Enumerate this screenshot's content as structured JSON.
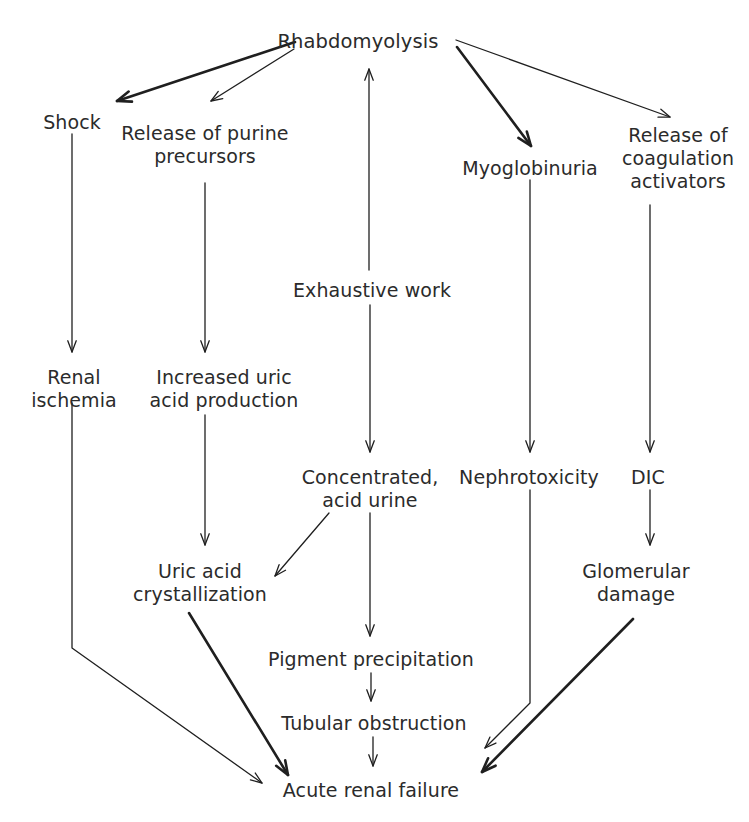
{
  "diagram": {
    "stroke_color": "#1f1f1f",
    "text_color": "#2b2b2b",
    "background": "#ffffff",
    "nodes": [
      {
        "id": "rhabdomyolysis",
        "label": "Rhabdomyolysis",
        "x": 358,
        "y": 30
      },
      {
        "id": "shock",
        "label": "Shock",
        "x": 72,
        "y": 111
      },
      {
        "id": "release-purine-precursors",
        "label": "Release of purine\nprecursors",
        "x": 205,
        "y": 122
      },
      {
        "id": "myoglobinuria",
        "label": "Myoglobinuria",
        "x": 530,
        "y": 157
      },
      {
        "id": "release-coagulation-activators",
        "label": "Release of\ncoagulation\nactivators",
        "x": 678,
        "y": 124
      },
      {
        "id": "exhaustive-work",
        "label": "Exhaustive work",
        "x": 372,
        "y": 279
      },
      {
        "id": "renal-ischemia",
        "label": "Renal\nischemia",
        "x": 74,
        "y": 366
      },
      {
        "id": "increased-uric-acid-production",
        "label": "Increased uric\nacid production",
        "x": 224,
        "y": 366
      },
      {
        "id": "concentrated-acid-urine",
        "label": "Concentrated,\nacid urine",
        "x": 370,
        "y": 466
      },
      {
        "id": "nephrotoxicity",
        "label": "Nephrotoxicity",
        "x": 529,
        "y": 466
      },
      {
        "id": "dic",
        "label": "DIC",
        "x": 648,
        "y": 466
      },
      {
        "id": "uric-acid-crystallization",
        "label": "Uric acid\ncrystallization",
        "x": 200,
        "y": 560
      },
      {
        "id": "glomerular-damage",
        "label": "Glomerular\ndamage",
        "x": 636,
        "y": 560
      },
      {
        "id": "pigment-precipitation",
        "label": "Pigment precipitation",
        "x": 371,
        "y": 648
      },
      {
        "id": "tubular-obstruction",
        "label": "Tubular obstruction",
        "x": 374,
        "y": 712
      },
      {
        "id": "acute-renal-failure",
        "label": "Acute renal failure",
        "x": 371,
        "y": 779
      }
    ],
    "edges": [
      {
        "id": "rhabdomyolysis-to-shock",
        "from": "rhabdomyolysis",
        "to": "shock",
        "points": [
          [
            295,
            42
          ],
          [
            117,
            101
          ]
        ],
        "weight": "thick"
      },
      {
        "id": "rhabdomyolysis-to-release-purine-precursors",
        "from": "rhabdomyolysis",
        "to": "release-purine-precursors",
        "points": [
          [
            294,
            49
          ],
          [
            211,
            101
          ]
        ],
        "weight": "thin"
      },
      {
        "id": "exhaustive-work-to-rhabdomyolysis",
        "from": "exhaustive-work",
        "to": "rhabdomyolysis",
        "points": [
          [
            369,
            270
          ],
          [
            369,
            69
          ]
        ],
        "weight": "thin"
      },
      {
        "id": "rhabdomyolysis-to-myoglobinuria",
        "from": "rhabdomyolysis",
        "to": "myoglobinuria",
        "points": [
          [
            457,
            47
          ],
          [
            531,
            146
          ]
        ],
        "weight": "thick"
      },
      {
        "id": "rhabdomyolysis-to-release-coagulation-activators",
        "from": "rhabdomyolysis",
        "to": "release-coagulation-activators",
        "points": [
          [
            456,
            40
          ],
          [
            670,
            117
          ]
        ],
        "weight": "thin"
      },
      {
        "id": "shock-to-renal-ischemia",
        "from": "shock",
        "to": "renal-ischemia",
        "points": [
          [
            72,
            134
          ],
          [
            72,
            352
          ]
        ],
        "weight": "thin"
      },
      {
        "id": "release-purine-precursors-to-increased-uric-acid-production",
        "from": "release-purine-precursors",
        "to": "increased-uric-acid-production",
        "points": [
          [
            205,
            183
          ],
          [
            205,
            352
          ]
        ],
        "weight": "thin"
      },
      {
        "id": "exhaustive-work-to-concentrated-acid-urine",
        "from": "exhaustive-work",
        "to": "concentrated-acid-urine",
        "points": [
          [
            370,
            305
          ],
          [
            370,
            452
          ]
        ],
        "weight": "thin"
      },
      {
        "id": "myoglobinuria-to-nephrotoxicity",
        "from": "myoglobinuria",
        "to": "nephrotoxicity",
        "points": [
          [
            530,
            180
          ],
          [
            530,
            452
          ]
        ],
        "weight": "thin"
      },
      {
        "id": "release-coagulation-activators-to-dic",
        "from": "release-coagulation-activators",
        "to": "dic",
        "points": [
          [
            650,
            205
          ],
          [
            650,
            452
          ]
        ],
        "weight": "thin"
      },
      {
        "id": "increased-uric-acid-production-to-uric-acid-crystallization",
        "from": "increased-uric-acid-production",
        "to": "uric-acid-crystallization",
        "points": [
          [
            205,
            415
          ],
          [
            205,
            545
          ]
        ],
        "weight": "thin"
      },
      {
        "id": "concentrated-acid-urine-to-uric-acid-crystallization",
        "from": "concentrated-acid-urine",
        "to": "uric-acid-crystallization",
        "points": [
          [
            329,
            513
          ],
          [
            275,
            576
          ]
        ],
        "weight": "thin"
      },
      {
        "id": "dic-to-glomerular-damage",
        "from": "dic",
        "to": "glomerular-damage",
        "points": [
          [
            650,
            490
          ],
          [
            650,
            545
          ]
        ],
        "weight": "thin"
      },
      {
        "id": "concentrated-acid-urine-to-pigment-precipitation",
        "from": "concentrated-acid-urine",
        "to": "pigment-precipitation",
        "points": [
          [
            370,
            513
          ],
          [
            370,
            636
          ]
        ],
        "weight": "thin"
      },
      {
        "id": "pigment-precipitation-to-tubular-obstruction",
        "from": "pigment-precipitation",
        "to": "tubular-obstruction",
        "points": [
          [
            371,
            673
          ],
          [
            371,
            701
          ]
        ],
        "weight": "thin"
      },
      {
        "id": "tubular-obstruction-to-acute-renal-failure",
        "from": "tubular-obstruction",
        "to": "acute-renal-failure",
        "points": [
          [
            373,
            737
          ],
          [
            373,
            766
          ]
        ],
        "weight": "thin"
      },
      {
        "id": "renal-ischemia-to-acute-renal-failure",
        "from": "renal-ischemia",
        "to": "acute-renal-failure",
        "points": [
          [
            72,
            403
          ],
          [
            72,
            648
          ],
          [
            262,
            783
          ]
        ],
        "weight": "thin"
      },
      {
        "id": "uric-acid-crystallization-to-acute-renal-failure",
        "from": "uric-acid-crystallization",
        "to": "acute-renal-failure",
        "points": [
          [
            189,
            613
          ],
          [
            288,
            775
          ]
        ],
        "weight": "thick"
      },
      {
        "id": "nephrotoxicity-to-acute-renal-failure",
        "from": "nephrotoxicity",
        "to": "acute-renal-failure",
        "points": [
          [
            530,
            490
          ],
          [
            530,
            703
          ],
          [
            485,
            748
          ]
        ],
        "weight": "thin"
      },
      {
        "id": "glomerular-damage-to-acute-renal-failure",
        "from": "glomerular-damage",
        "to": "acute-renal-failure",
        "points": [
          [
            633,
            619
          ],
          [
            482,
            772
          ]
        ],
        "weight": "thick"
      }
    ]
  }
}
